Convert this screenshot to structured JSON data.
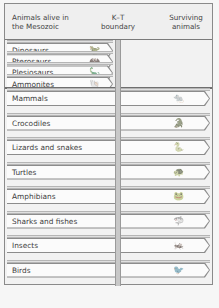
{
  "header": {
    "col1": "Animals alive in the Mesozoic",
    "col1_line1": "Animals alive in",
    "col1_line2": "the Mesozoic",
    "col2_line1": "K–T",
    "col2_line2": "boundary",
    "col3_line1": "Surviving",
    "col3_line2": "animals"
  },
  "extinct": [
    {
      "label": "Dinosaurs",
      "icon": "dinosaur-icon",
      "glyph": "🦖"
    },
    {
      "label": "Pterosaurs",
      "icon": "pterosaur-icon",
      "glyph": "🦇"
    },
    {
      "label": "Plesiosaurs",
      "icon": "plesiosaur-icon",
      "glyph": "🦕"
    },
    {
      "label": "Ammonites",
      "icon": "ammonite-icon",
      "glyph": "🐚"
    }
  ],
  "surviving": [
    {
      "label": "Mammals",
      "icon": "mammal-icon",
      "glyph": "🐀"
    },
    {
      "label": "Crocodiles",
      "icon": "crocodile-icon",
      "glyph": "🐊"
    },
    {
      "label": "Lizards and snakes",
      "icon": "snake-icon",
      "glyph": "🐍"
    },
    {
      "label": "Turtles",
      "icon": "turtle-icon",
      "glyph": "🐢"
    },
    {
      "label": "Amphibians",
      "icon": "frog-icon",
      "glyph": "🐸"
    },
    {
      "label": "Sharks and fishes",
      "icon": "shark-icon",
      "glyph": "🦈"
    },
    {
      "label": "Insects",
      "icon": "insect-icon",
      "glyph": "🦗"
    },
    {
      "label": "Birds",
      "icon": "bird-icon",
      "glyph": "🐦"
    }
  ]
}
